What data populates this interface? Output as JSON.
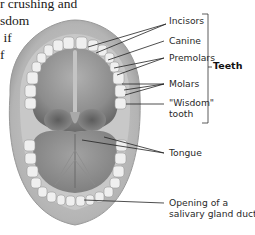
{
  "body_text": {
    "lines": [
      "r crushing and",
      "sdom",
      " if",
      "",
      "f"
    ]
  },
  "diagram": {
    "labels": {
      "incisors": "Incisors",
      "canine": "Canine",
      "premolars": "Premolars",
      "molars": "Molars",
      "wisdom_tooth_line1": "\"Wisdom\"",
      "wisdom_tooth_line2": "tooth",
      "tongue": "Tongue",
      "salivary_line1": "Opening of a",
      "salivary_line2": "salivary gland duct"
    },
    "group_label": "Teeth",
    "colors": {
      "gum": "#b9b9b9",
      "palate": "#8a8a8a",
      "teeth": "#eeeeee",
      "leader_lines": "#222222"
    }
  }
}
